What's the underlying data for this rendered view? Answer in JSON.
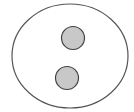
{
  "diagram": {
    "background": "#ffffff",
    "outer_ellipse": {
      "cx": 70,
      "cy": 56,
      "rx": 58,
      "ry": 52,
      "fill": "#ffffff",
      "stroke": "#555555"
    },
    "inner_circles": [
      {
        "cx": 73,
        "cy": 38,
        "r": 11.5,
        "fill": "#c8c8c8",
        "stroke": "#444444"
      },
      {
        "cx": 67,
        "cy": 78,
        "r": 11.5,
        "fill": "#c8c8c8",
        "stroke": "#444444"
      }
    ]
  }
}
